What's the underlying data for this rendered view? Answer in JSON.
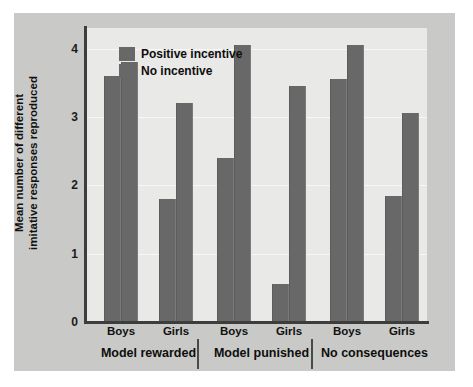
{
  "chart_data": {
    "type": "bar",
    "title": "",
    "subtitle": "",
    "xlabel": "",
    "ylabel": "Mean number of different imitative responses reproduced",
    "ylabel_lines": [
      "Mean number of different",
      "imitative responses reproduced"
    ],
    "ylim": [
      0,
      4.3
    ],
    "ytick_labels": [
      "0",
      "1",
      "2",
      "3",
      "4"
    ],
    "ytick_values": [
      0,
      1,
      2,
      3,
      4
    ],
    "grid": true,
    "grid_axis": "y",
    "legend_position": "top-left-inside",
    "bar_color": "#686868",
    "plot_background": "#e9e9e7",
    "figure_background": "#c9c9c7",
    "categories": [
      "Boys",
      "Girls",
      "Boys",
      "Girls",
      "Boys",
      "Girls"
    ],
    "groups": [
      "Model rewarded",
      "Model punished",
      "No consequences"
    ],
    "series": [
      {
        "name": "Positive incentive",
        "color": "#686868",
        "values": [
          3.6,
          1.8,
          2.4,
          0.55,
          3.55,
          1.85
        ]
      },
      {
        "name": "No incentive",
        "color": "#686868",
        "values": [
          3.8,
          3.2,
          4.05,
          3.45,
          4.05,
          3.05
        ]
      }
    ],
    "bars": [
      {
        "group": "Model rewarded",
        "sex": "Boys",
        "series": "Positive incentive",
        "value": 3.6
      },
      {
        "group": "Model rewarded",
        "sex": "Boys",
        "series": "No incentive",
        "value": 3.8
      },
      {
        "group": "Model rewarded",
        "sex": "Girls",
        "series": "Positive incentive",
        "value": 1.8
      },
      {
        "group": "Model rewarded",
        "sex": "Girls",
        "series": "No incentive",
        "value": 3.2
      },
      {
        "group": "Model punished",
        "sex": "Boys",
        "series": "Positive incentive",
        "value": 2.4
      },
      {
        "group": "Model punished",
        "sex": "Boys",
        "series": "No incentive",
        "value": 4.05
      },
      {
        "group": "Model punished",
        "sex": "Girls",
        "series": "Positive incentive",
        "value": 0.55
      },
      {
        "group": "Model punished",
        "sex": "Girls",
        "series": "No incentive",
        "value": 3.45
      },
      {
        "group": "No consequences",
        "sex": "Boys",
        "series": "Positive incentive",
        "value": 3.55
      },
      {
        "group": "No consequences",
        "sex": "Boys",
        "series": "No incentive",
        "value": 4.05
      },
      {
        "group": "No consequences",
        "sex": "Girls",
        "series": "Positive incentive",
        "value": 1.85
      },
      {
        "group": "No consequences",
        "sex": "Girls",
        "series": "No incentive",
        "value": 3.05
      }
    ]
  },
  "legend": {
    "items": [
      {
        "label": "Positive incentive"
      },
      {
        "label": "No incentive"
      }
    ]
  },
  "axes": {
    "y_title_line1": "Mean number of different",
    "y_title_line2": "imitative responses reproduced",
    "y_ticks": [
      "4",
      "3",
      "2",
      "1",
      "0"
    ]
  },
  "x_axis": {
    "tick_labels": [
      "Boys",
      "Girls",
      "Boys",
      "Girls",
      "Boys",
      "Girls"
    ],
    "group_labels": [
      "Model rewarded",
      "Model punished",
      "No consequences"
    ]
  }
}
